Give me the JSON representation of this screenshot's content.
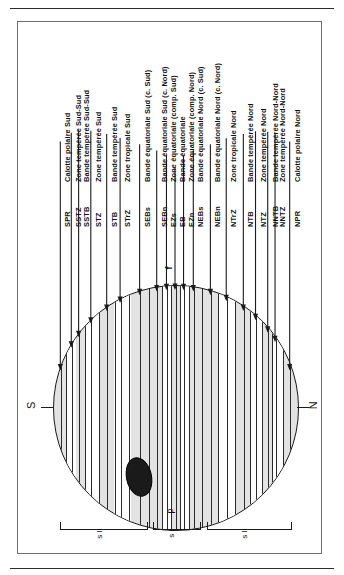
{
  "figure": {
    "poles": {
      "south": "S",
      "north": "N"
    },
    "central_meridian_marker": "p",
    "equator_marker": "f",
    "bands": [
      {
        "code": "SPR",
        "desc": "Calotte polaire Sud",
        "pos": 3.0,
        "arrow_len": 228,
        "shade": "grey"
      },
      {
        "code": "SSTZ",
        "desc": "Zone tempérée Sud-Sud",
        "pos": 7.5,
        "arrow_len": 214,
        "shade": "white"
      },
      {
        "code": "SSTB",
        "desc": "Bande tempérée Sud-Sud",
        "pos": 10.5,
        "arrow_len": 206,
        "shade": "grey"
      },
      {
        "code": "STZ",
        "desc": "Zone tempérée Sud",
        "pos": 15.5,
        "arrow_len": 192,
        "shade": "white"
      },
      {
        "code": "STB",
        "desc": "Bande tempérée Sud",
        "pos": 22.0,
        "arrow_len": 176,
        "shade": "grey"
      },
      {
        "code": "STrZ",
        "desc": "Zone tropicale Sud",
        "pos": 27.5,
        "arrow_len": 164,
        "shade": "white"
      },
      {
        "code": "SEBs",
        "desc": "Bande équatoriale Sud (c. Sud)",
        "pos": 35.5,
        "arrow_len": 150,
        "shade": "grey"
      },
      {
        "code": "SEBn",
        "desc": "Bande équatoriale Sud (c. Nord)",
        "pos": 42.5,
        "arrow_len": 140,
        "shade": "grey"
      },
      {
        "code": "EZs",
        "desc": "Zone équatoriale (comp. Sud)",
        "pos": 46.5,
        "arrow_len": 134,
        "shade": "white"
      },
      {
        "code": "EB",
        "desc": "Bande équatoriale",
        "pos": 50.0,
        "arrow_len": 122,
        "shade": "line"
      },
      {
        "code": "EZn",
        "desc": "Zone équatoriale (comp. Nord)",
        "pos": 53.5,
        "arrow_len": 134,
        "shade": "white"
      },
      {
        "code": "NEBs",
        "desc": "Bande équatoriale Nord (c. Sud)",
        "pos": 57.5,
        "arrow_len": 140,
        "shade": "grey"
      },
      {
        "code": "NEBn",
        "desc": "Bande équatoriale Nord (c. Nord)",
        "pos": 64.5,
        "arrow_len": 150,
        "shade": "grey"
      },
      {
        "code": "NTrZ",
        "desc": "Zone tropicale Nord",
        "pos": 71.0,
        "arrow_len": 162,
        "shade": "white"
      },
      {
        "code": "NTB",
        "desc": "Bande tempérée Nord",
        "pos": 78.0,
        "arrow_len": 176,
        "shade": "grey"
      },
      {
        "code": "NTZ",
        "desc": "Zone tempérée Nord",
        "pos": 83.0,
        "arrow_len": 188,
        "shade": "white"
      },
      {
        "code": "NNTB",
        "desc": "Bande tempérée Nord-Nord",
        "pos": 88.0,
        "arrow_len": 200,
        "shade": "grey"
      },
      {
        "code": "NNTZ",
        "desc": "Zone tempérée Nord-Nord",
        "pos": 91.0,
        "arrow_len": 208,
        "shade": "white"
      },
      {
        "code": "NPR",
        "desc": "Calotte polaire Nord",
        "pos": 97.0,
        "arrow_len": 228,
        "shade": "grey"
      }
    ],
    "brackets": [
      {
        "label": "s II",
        "start": 3.0,
        "end": 38.0
      },
      {
        "label": "s I",
        "start": 41.0,
        "end": 60.0
      },
      {
        "label": "s II",
        "start": 63.0,
        "end": 97.0
      }
    ],
    "colors": {
      "ink": "#1b1b1b",
      "disc_fill": "#e3e3e3",
      "zone_fill": "#ffffff",
      "spot_fill": "#1a1a1a",
      "frame": "#6d6d6d"
    }
  }
}
